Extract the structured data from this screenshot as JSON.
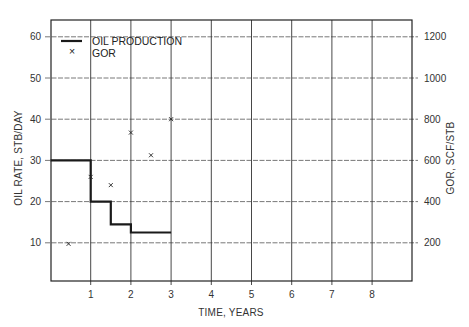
{
  "chart_data": {
    "type": "line",
    "title": "",
    "xlabel": "TIME, YEARS",
    "ylabel": "OIL RATE, STB/DAY",
    "y2label": "GOR, SCF/STB",
    "xlim": [
      0,
      9
    ],
    "ylim": [
      0,
      63
    ],
    "y2lim": [
      0,
      1260
    ],
    "grid": true,
    "legend_position": "upper-left",
    "x_ticks": [
      1,
      2,
      3,
      4,
      5,
      6,
      7,
      8
    ],
    "y_ticks": [
      10,
      20,
      30,
      40,
      50,
      60
    ],
    "y2_ticks": [
      200,
      400,
      600,
      800,
      1000,
      1200
    ],
    "series": [
      {
        "name": "OIL PRODUCTION",
        "kind": "step",
        "axis": "left",
        "style": "solid-thick-line",
        "x": [
          0,
          1,
          1,
          1.5,
          1.5,
          2,
          2,
          3
        ],
        "y": [
          30,
          30,
          20,
          20,
          14.5,
          14.5,
          12.5,
          12.5
        ]
      },
      {
        "name": "GOR",
        "kind": "scatter",
        "axis": "right",
        "marker": "x",
        "x": [
          0.45,
          1.0,
          1.5,
          2.0,
          2.5,
          3.0
        ],
        "y": [
          195,
          520,
          480,
          735,
          625,
          800
        ]
      }
    ]
  },
  "legend": {
    "items": [
      {
        "label": "OIL PRODUCTION",
        "symbol": "line"
      },
      {
        "label": "GOR",
        "symbol": "×"
      }
    ]
  },
  "colors": {
    "line": "#1a1a1a",
    "grid": "#555555",
    "frame": "#222222",
    "text": "#333333"
  }
}
